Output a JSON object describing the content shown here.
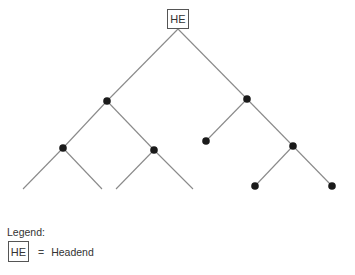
{
  "diagram": {
    "type": "tree-topology",
    "root": {
      "id": "HE",
      "label": "HE",
      "x": 178,
      "y": 19,
      "box": {
        "x": 167,
        "y": 9,
        "w": 22,
        "h": 20
      }
    },
    "line_color": "#8a8a8a",
    "node_color": "#1a1a1a",
    "nodes": [
      {
        "id": "n1",
        "x": 107,
        "y": 101
      },
      {
        "id": "n2",
        "x": 247,
        "y": 99
      },
      {
        "id": "n3",
        "x": 63,
        "y": 148
      },
      {
        "id": "n4",
        "x": 154,
        "y": 150
      },
      {
        "id": "n5",
        "x": 206,
        "y": 141
      },
      {
        "id": "n6",
        "x": 293,
        "y": 146
      },
      {
        "id": "n7",
        "x": 255,
        "y": 186
      },
      {
        "id": "n8",
        "x": 332,
        "y": 186
      }
    ],
    "edges": [
      {
        "x1": 178,
        "y1": 29,
        "x2": 107,
        "y2": 101
      },
      {
        "x1": 178,
        "y1": 29,
        "x2": 247,
        "y2": 99
      },
      {
        "x1": 107,
        "y1": 101,
        "x2": 63,
        "y2": 148
      },
      {
        "x1": 107,
        "y1": 101,
        "x2": 154,
        "y2": 150
      },
      {
        "x1": 247,
        "y1": 99,
        "x2": 206,
        "y2": 141
      },
      {
        "x1": 247,
        "y1": 99,
        "x2": 293,
        "y2": 146
      },
      {
        "x1": 63,
        "y1": 148,
        "x2": 23,
        "y2": 189
      },
      {
        "x1": 63,
        "y1": 148,
        "x2": 102,
        "y2": 189
      },
      {
        "x1": 154,
        "y1": 150,
        "x2": 116,
        "y2": 189
      },
      {
        "x1": 154,
        "y1": 150,
        "x2": 193,
        "y2": 189
      },
      {
        "x1": 293,
        "y1": 146,
        "x2": 255,
        "y2": 186
      },
      {
        "x1": 293,
        "y1": 146,
        "x2": 332,
        "y2": 186
      }
    ]
  },
  "legend": {
    "title": "Legend:",
    "items": [
      {
        "symbol": "HE",
        "equals": "=",
        "label": "Headend"
      }
    ]
  }
}
